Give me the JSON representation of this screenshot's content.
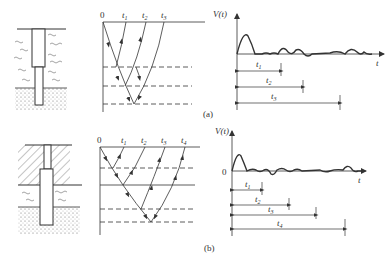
{
  "figure": {
    "panel_a": {
      "caption": "(a)",
      "wave_diagram": {
        "origin_label": "0",
        "time_labels": [
          "t1",
          "t2",
          "t3"
        ]
      },
      "signal_plot": {
        "y_axis_label": "V(t)",
        "x_axis_label": "t",
        "intervals": [
          "t1",
          "t2",
          "t3"
        ]
      },
      "pile": {
        "description": "pile in soft soil (water-wave pattern) over sandy base, with reduced section at toe"
      }
    },
    "panel_b": {
      "caption": "(b)",
      "wave_diagram": {
        "origin_label": "0",
        "time_labels": [
          "t1",
          "t2",
          "t3",
          "t4"
        ]
      },
      "signal_plot": {
        "y_axis_label": "V(t)",
        "zero_label": "0",
        "x_axis_label": "t",
        "intervals": [
          "t1",
          "t2",
          "t3",
          "t4"
        ]
      },
      "pile": {
        "description": "pile through hatched upper layer, soft layer, sandy base, with enlarged section in middle"
      }
    },
    "colors": {
      "line": "#333333",
      "background": "#ffffff"
    }
  }
}
